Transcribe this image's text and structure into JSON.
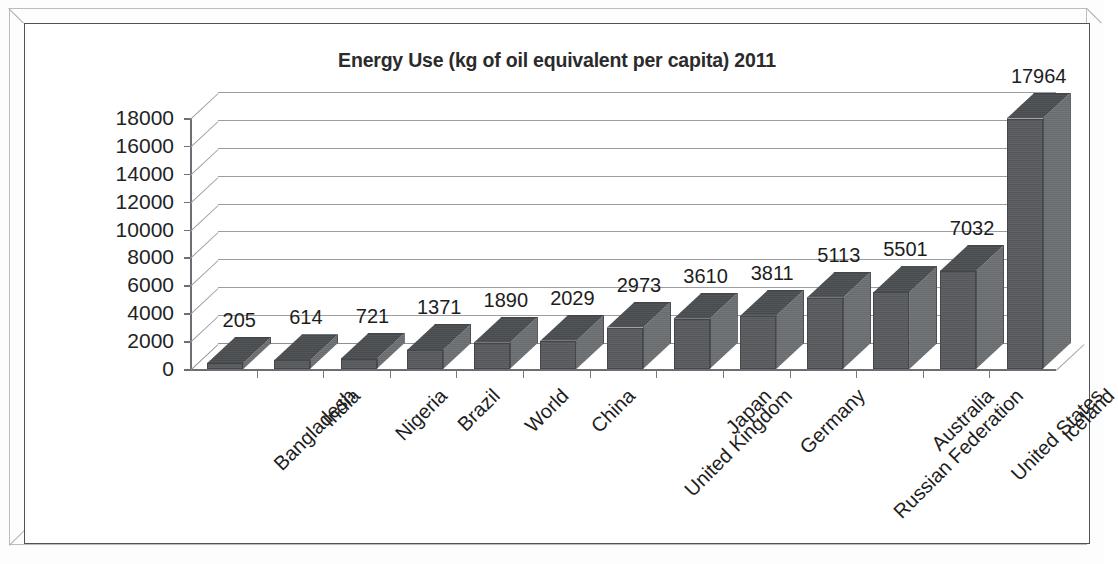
{
  "chart_data": {
    "type": "bar",
    "title": "Energy Use (kg of oil equivalent per capita) 2011",
    "xlabel": "",
    "ylabel": "",
    "ylim": [
      0,
      18000
    ],
    "ytick_interval": 2000,
    "ytick_labels": [
      "18000",
      "16000",
      "14000",
      "12000",
      "10000",
      "8000",
      "6000",
      "4000",
      "2000",
      "0"
    ],
    "ytick_values": [
      18000,
      16000,
      14000,
      12000,
      10000,
      8000,
      6000,
      4000,
      2000,
      0
    ],
    "grid": true,
    "legend": "none",
    "style": "3d-column",
    "data_labels": true,
    "categories": [
      "Bangladesh",
      "India",
      "Nigeria",
      "Brazil",
      "World",
      "China",
      "United Kingdom",
      "Japan",
      "Germany",
      "Russian Federation",
      "Australia",
      "United States",
      "Iceland"
    ],
    "values": [
      205,
      614,
      721,
      1371,
      1890,
      2029,
      2973,
      3610,
      3811,
      5113,
      5501,
      7032,
      17964
    ],
    "value_labels": [
      "205",
      "614",
      "721",
      "1371",
      "1890",
      "2029",
      "2973",
      "3610",
      "3811",
      "5113",
      "5501",
      "7032",
      "17964"
    ],
    "series": [
      {
        "name": "Energy Use",
        "values": [
          205,
          614,
          721,
          1371,
          1890,
          2029,
          2973,
          3610,
          3811,
          5113,
          5501,
          7032,
          17964
        ]
      }
    ],
    "colors": {
      "bar_front": "#585b5e",
      "bar_side": "#6e7174",
      "bar_top": "#4c4f52",
      "gridline": "#9a9da1",
      "axis": "#6b6e72",
      "text": "#1d1d1d",
      "plot_background": "#ffffff"
    }
  }
}
